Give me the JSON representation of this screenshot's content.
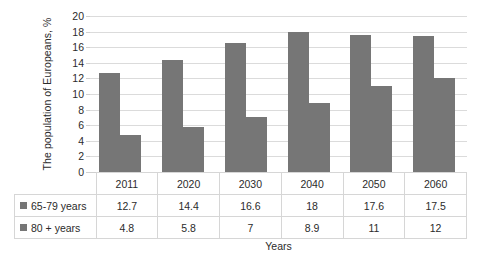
{
  "chart_data": {
    "type": "bar",
    "title": "",
    "xlabel": "Years",
    "ylabel": "The population of Europeans, %",
    "categories": [
      "2011",
      "2020",
      "2030",
      "2040",
      "2050",
      "2060"
    ],
    "series": [
      {
        "name": "65-79 years",
        "values": [
          12.7,
          14.4,
          16.6,
          18,
          17.6,
          17.5
        ]
      },
      {
        "name": "80 + years",
        "values": [
          4.8,
          5.8,
          7,
          8.9,
          11,
          12
        ]
      }
    ],
    "ylim": [
      0,
      20
    ],
    "ytick_step": 2,
    "yticks": [
      "20",
      "18",
      "16",
      "14",
      "12",
      "10",
      "8",
      "6",
      "4",
      "2",
      "0"
    ],
    "grid": true,
    "legend_position": "table-row-labels",
    "colors": {
      "series_65_79": "#767676",
      "series_80_plus": "#767676",
      "gridline": "#dbdbdb",
      "table_border": "#d6d6d6",
      "text": "#2b2b2b",
      "background": "#ffffff"
    }
  },
  "table": {
    "header": [
      "",
      "2011",
      "2020",
      "2030",
      "2040",
      "2050",
      "2060"
    ],
    "rows": [
      {
        "label": "65-79 years",
        "values": [
          "12.7",
          "14.4",
          "16.6",
          "18",
          "17.6",
          "17.5"
        ]
      },
      {
        "label": "80 + years",
        "values": [
          "4.8",
          "5.8",
          "7",
          "8.9",
          "11",
          "12"
        ]
      }
    ]
  }
}
